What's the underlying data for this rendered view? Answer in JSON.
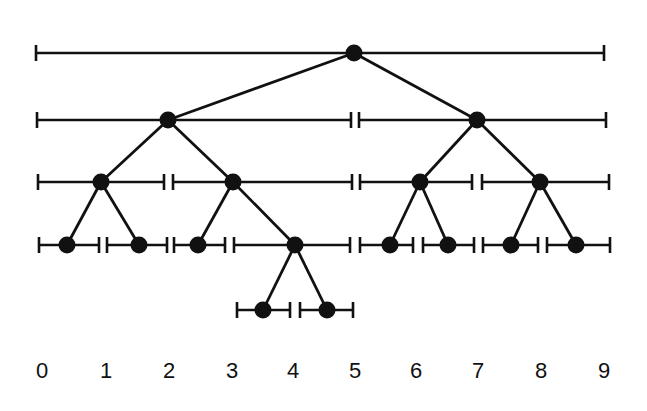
{
  "diagram": {
    "type": "segment-tree",
    "ink_color": "#111111",
    "background": "#ffffff",
    "axis": {
      "labels": [
        "0",
        "1",
        "2",
        "3",
        "4",
        "5",
        "6",
        "7",
        "8",
        "9"
      ],
      "label_x": [
        42,
        106,
        169,
        232,
        293,
        355,
        416,
        478,
        541,
        604
      ]
    },
    "levels": [
      {
        "y": 53,
        "segments": [
          {
            "x1": 36,
            "x2": 604,
            "node_x": 354,
            "interval": "[0,9]"
          }
        ]
      },
      {
        "y": 120,
        "segments": [
          {
            "x1": 37,
            "x2": 351,
            "node_x": 168,
            "interval": "[0,5)"
          },
          {
            "x1": 359,
            "x2": 606,
            "node_x": 477,
            "interval": "[5,9]"
          }
        ]
      },
      {
        "y": 182,
        "segments": [
          {
            "x1": 38,
            "x2": 164,
            "node_x": 101,
            "interval": "[0,2)"
          },
          {
            "x1": 173,
            "x2": 352,
            "node_x": 233,
            "interval": "[2,5)"
          },
          {
            "x1": 360,
            "x2": 472,
            "node_x": 420,
            "interval": "[5,7)"
          },
          {
            "x1": 482,
            "x2": 609,
            "node_x": 540,
            "interval": "[7,9]"
          }
        ]
      },
      {
        "y": 245,
        "segments": [
          {
            "x1": 39,
            "x2": 99,
            "node_x": 67,
            "interval": "[0,1)"
          },
          {
            "x1": 107,
            "x2": 167,
            "node_x": 139,
            "interval": "[1,2)"
          },
          {
            "x1": 174,
            "x2": 225,
            "node_x": 198,
            "interval": "[2,3)"
          },
          {
            "x1": 234,
            "x2": 350,
            "node_x": 295,
            "interval": "[3,5)"
          },
          {
            "x1": 360,
            "x2": 413,
            "node_x": 390,
            "interval": "[5,6)"
          },
          {
            "x1": 423,
            "x2": 474,
            "node_x": 448,
            "interval": "[6,7)"
          },
          {
            "x1": 483,
            "x2": 538,
            "node_x": 511,
            "interval": "[7,8)"
          },
          {
            "x1": 547,
            "x2": 610,
            "node_x": 576,
            "interval": "[8,9]"
          }
        ]
      },
      {
        "y": 310,
        "segments": [
          {
            "x1": 237,
            "x2": 290,
            "node_x": 263,
            "interval": "[3,4)"
          },
          {
            "x1": 300,
            "x2": 353,
            "node_x": 327,
            "interval": "[4,5)"
          }
        ]
      }
    ],
    "edges": [
      [
        0,
        0,
        1,
        0
      ],
      [
        0,
        0,
        1,
        1
      ],
      [
        1,
        0,
        2,
        0
      ],
      [
        1,
        0,
        2,
        1
      ],
      [
        1,
        1,
        2,
        2
      ],
      [
        1,
        1,
        2,
        3
      ],
      [
        2,
        0,
        3,
        0
      ],
      [
        2,
        0,
        3,
        1
      ],
      [
        2,
        1,
        3,
        2
      ],
      [
        2,
        1,
        3,
        3
      ],
      [
        2,
        2,
        3,
        4
      ],
      [
        2,
        2,
        3,
        5
      ],
      [
        2,
        3,
        3,
        6
      ],
      [
        2,
        3,
        3,
        7
      ],
      [
        3,
        3,
        4,
        0
      ],
      [
        3,
        3,
        4,
        1
      ]
    ]
  }
}
